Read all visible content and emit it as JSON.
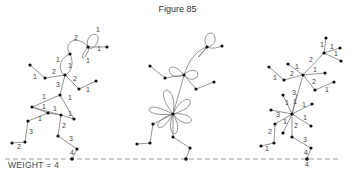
{
  "figure": {
    "title": "Figure 85",
    "weight_label": "WEIGHT = 4",
    "bottom_label": "4"
  },
  "trees": [
    {
      "name": "left-weighted-tree",
      "edge_labels": [
        "1",
        "2",
        "1",
        "1",
        "1",
        "1",
        "2",
        "1",
        "2",
        "1",
        "3",
        "1",
        "1",
        "1",
        "1",
        "1",
        "1",
        "3",
        "2",
        "2",
        "3",
        "1",
        "4"
      ]
    },
    {
      "name": "middle-loop-tree",
      "edge_labels": []
    },
    {
      "name": "right-weighted-tree",
      "edge_labels": [
        "1",
        "1",
        "1",
        "2",
        "1",
        "1",
        "2",
        "1",
        "2",
        "1",
        "3",
        "1",
        "1",
        "1",
        "3",
        "1",
        "2",
        "1",
        "2",
        "3",
        "1",
        "4"
      ]
    }
  ]
}
